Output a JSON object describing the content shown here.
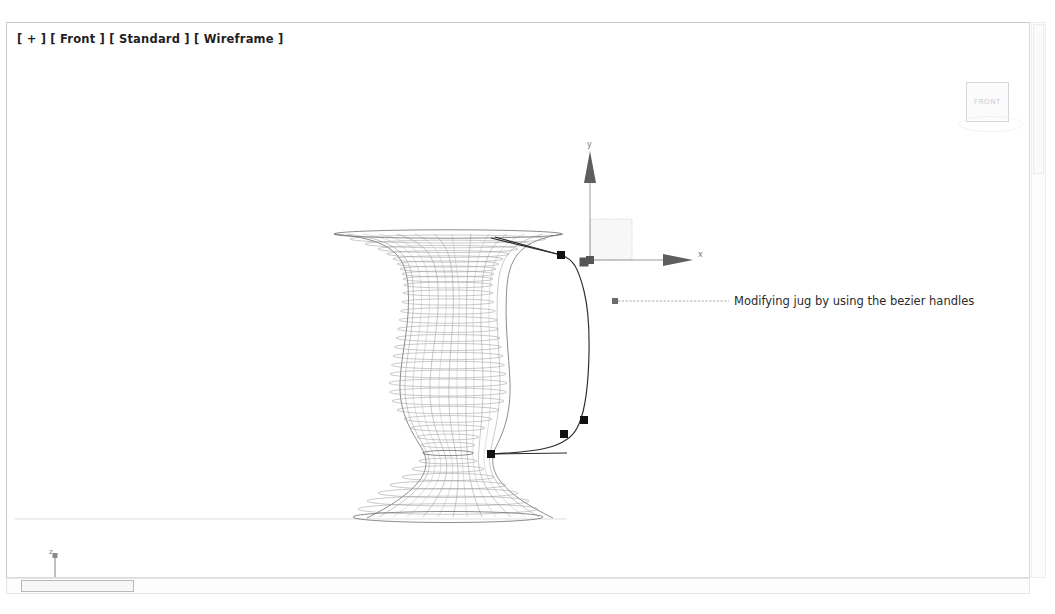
{
  "window": {
    "app": "3D modeling viewport",
    "background_color": "#ffffff"
  },
  "viewport": {
    "label": "[ + ] [ Front ] [ Standard ] [ Wireframe ]",
    "label_parts": [
      "[ + ]",
      "[ Front ]",
      "[ Standard ]",
      "[ Wireframe ]"
    ],
    "shading": "Wireframe",
    "view": "Front",
    "preset": "Standard",
    "border_color": "#c9c9c9"
  },
  "viewcube": {
    "face_label": "FRONT",
    "label_color": "#cfcfcf"
  },
  "annotation": {
    "text": "Modifying jug by using the bezier handles",
    "leader_color": "#8f8f8f",
    "text_color": "#2b2b2b"
  },
  "gizmo": {
    "name": "move-transform-gizmo",
    "origin": {
      "x": 583,
      "y": 237
    },
    "axes": [
      {
        "label": "y",
        "direction": "up",
        "color": "#5e5e5e"
      },
      {
        "label": "x",
        "direction": "right",
        "color": "#5e5e5e"
      }
    ],
    "plane_handle": "xy-plane"
  },
  "axis_tripod": {
    "name": "world-axis-tripod",
    "labels": [
      "z",
      "y",
      "x"
    ],
    "origin": {
      "x": 48,
      "y": 568
    },
    "color": "#8a8a8a"
  },
  "object": {
    "name": "jug",
    "type": "lathe-surface-of-revolution",
    "display": "wireframe",
    "wire_color": "#9d9d9d",
    "profile_spline": {
      "name": "bezier-profile-spline",
      "stroke": "#2b2b2b",
      "control_vertices": [
        {
          "id": "cv-1",
          "x": 554,
          "y": 232,
          "selected": false
        },
        {
          "id": "cv-2",
          "x": 577,
          "y": 239,
          "selected": true
        },
        {
          "id": "cv-3",
          "x": 577,
          "y": 397,
          "selected": false
        },
        {
          "id": "cv-4",
          "x": 557,
          "y": 411,
          "selected": false
        },
        {
          "id": "cv-5",
          "x": 484,
          "y": 431,
          "selected": false
        }
      ]
    }
  },
  "scrollbars": {
    "horizontal": {
      "thumb_left": 14,
      "thumb_width": 113
    },
    "vertical": {
      "thumb_top": 1,
      "thumb_height": 150
    }
  }
}
